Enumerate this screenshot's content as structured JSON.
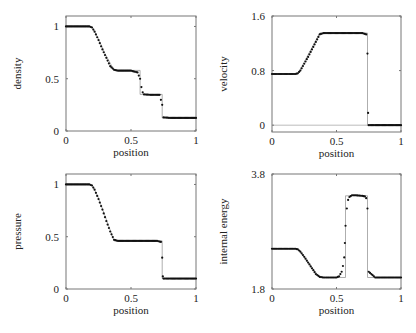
{
  "chart_data": [
    {
      "type": "scatter",
      "id": "density",
      "xlabel": "position",
      "ylabel": "density",
      "xlim": [
        0,
        1
      ],
      "ylim": [
        0,
        1.1
      ],
      "xticks": [
        "0",
        "0.5",
        "1"
      ],
      "yticks": [
        "0",
        "0.5",
        "1"
      ],
      "ytick_values": [
        0,
        0.5,
        1
      ],
      "grid": false,
      "series": [
        {
          "name": "exact",
          "style": "line",
          "x": [
            0,
            0.2,
            0.25,
            0.3,
            0.37,
            0.57,
            0.57,
            0.74,
            0.74,
            1
          ],
          "y": [
            1,
            1,
            0.88,
            0.74,
            0.58,
            0.58,
            0.35,
            0.35,
            0.125,
            0.125
          ]
        },
        {
          "name": "simulation",
          "style": "points",
          "x": [
            0,
            0.18,
            0.2,
            0.22,
            0.25,
            0.28,
            0.31,
            0.34,
            0.37,
            0.4,
            0.5,
            0.55,
            0.57,
            0.58,
            0.59,
            0.6,
            0.65,
            0.72,
            0.74,
            0.75,
            0.8,
            1
          ],
          "y": [
            1,
            1,
            0.99,
            0.95,
            0.87,
            0.78,
            0.7,
            0.62,
            0.585,
            0.577,
            0.577,
            0.56,
            0.5,
            0.42,
            0.37,
            0.35,
            0.346,
            0.346,
            0.25,
            0.13,
            0.125,
            0.125
          ]
        }
      ]
    },
    {
      "type": "scatter",
      "id": "velocity",
      "xlabel": "position",
      "ylabel": "velocity",
      "xlim": [
        0,
        1
      ],
      "ylim": [
        -0.1,
        1.6
      ],
      "xticks": [
        "0",
        "0.5",
        "1"
      ],
      "yticks": [
        "0",
        "0.8",
        "1.6"
      ],
      "ytick_values": [
        0,
        0.8,
        1.6
      ],
      "grid": false,
      "zero_line": true,
      "series": [
        {
          "name": "exact",
          "style": "line",
          "x": [
            0,
            0.2,
            0.37,
            0.74,
            0.74,
            1
          ],
          "y": [
            0.75,
            0.75,
            1.35,
            1.35,
            0,
            0
          ]
        },
        {
          "name": "simulation",
          "style": "points",
          "x": [
            0,
            0.18,
            0.2,
            0.22,
            0.25,
            0.28,
            0.31,
            0.34,
            0.37,
            0.4,
            0.5,
            0.6,
            0.7,
            0.73,
            0.74,
            0.745,
            0.75,
            0.8,
            1
          ],
          "y": [
            0.75,
            0.75,
            0.76,
            0.8,
            0.9,
            1.0,
            1.11,
            1.22,
            1.33,
            1.35,
            1.35,
            1.35,
            1.35,
            1.33,
            1.05,
            0.18,
            0.0,
            0.0,
            0.0
          ]
        }
      ]
    },
    {
      "type": "scatter",
      "id": "pressure",
      "xlabel": "position",
      "ylabel": "pressure",
      "xlim": [
        0,
        1
      ],
      "ylim": [
        0,
        1.1
      ],
      "xticks": [
        "0",
        "0.5",
        "1"
      ],
      "yticks": [
        "0",
        "0.5",
        "1"
      ],
      "ytick_values": [
        0,
        0.5,
        1
      ],
      "grid": false,
      "series": [
        {
          "name": "exact",
          "style": "line",
          "x": [
            0,
            0.2,
            0.25,
            0.3,
            0.37,
            0.74,
            0.74,
            1
          ],
          "y": [
            1,
            1,
            0.87,
            0.7,
            0.46,
            0.46,
            0.1,
            0.1
          ]
        },
        {
          "name": "simulation",
          "style": "points",
          "x": [
            0,
            0.18,
            0.2,
            0.22,
            0.25,
            0.28,
            0.31,
            0.34,
            0.37,
            0.4,
            0.5,
            0.6,
            0.7,
            0.73,
            0.74,
            0.745,
            0.75,
            0.8,
            1
          ],
          "y": [
            1,
            1,
            0.99,
            0.95,
            0.86,
            0.76,
            0.65,
            0.55,
            0.47,
            0.46,
            0.46,
            0.46,
            0.46,
            0.45,
            0.3,
            0.12,
            0.1,
            0.1,
            0.1
          ]
        }
      ]
    },
    {
      "type": "scatter",
      "id": "internal-energy",
      "xlabel": "position",
      "ylabel": "internal energy",
      "xlim": [
        0,
        1
      ],
      "ylim": [
        1.8,
        3.8
      ],
      "xticks": [
        "0",
        "0.5",
        "1"
      ],
      "yticks": [
        "1.8",
        "3.8"
      ],
      "ytick_values": [
        1.8,
        3.8
      ],
      "grid": false,
      "series": [
        {
          "name": "exact",
          "style": "line",
          "x": [
            0,
            0.2,
            0.37,
            0.57,
            0.57,
            0.74,
            0.74,
            1
          ],
          "y": [
            2.5,
            2.5,
            2.0,
            2.0,
            3.42,
            3.42,
            2.0,
            2.0
          ]
        },
        {
          "name": "simulation",
          "style": "points",
          "x": [
            0,
            0.18,
            0.2,
            0.22,
            0.25,
            0.28,
            0.31,
            0.34,
            0.37,
            0.4,
            0.45,
            0.5,
            0.52,
            0.53,
            0.54,
            0.55,
            0.56,
            0.565,
            0.57,
            0.58,
            0.59,
            0.6,
            0.62,
            0.65,
            0.7,
            0.72,
            0.73,
            0.74,
            0.75,
            0.8,
            1
          ],
          "y": [
            2.5,
            2.5,
            2.49,
            2.45,
            2.36,
            2.26,
            2.16,
            2.06,
            2.01,
            2.0,
            2.0,
            2.0,
            2.02,
            2.06,
            2.1,
            2.2,
            2.35,
            2.6,
            2.9,
            3.2,
            3.35,
            3.4,
            3.43,
            3.43,
            3.42,
            3.41,
            3.38,
            3.2,
            2.1,
            2.0,
            2.0
          ]
        }
      ]
    }
  ]
}
